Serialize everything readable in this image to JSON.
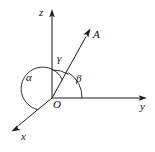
{
  "figure": {
    "kind": "3d-axes-direction-angles",
    "background_color": "#ffffff",
    "stroke_color": "#1a1a1a",
    "axes": [
      {
        "id": "z",
        "label": "z",
        "direction": "up"
      },
      {
        "id": "y",
        "label": "y",
        "direction": "right"
      },
      {
        "id": "x",
        "label": "x",
        "direction": "down-left"
      }
    ],
    "origin": {
      "label": "O"
    },
    "vector": {
      "label": "A",
      "direction": "up-right"
    },
    "angles": [
      {
        "id": "alpha",
        "label": "α",
        "between": "x-axis and vector A"
      },
      {
        "id": "beta",
        "label": "β",
        "between": "y-axis and vector A"
      },
      {
        "id": "gamma",
        "label": "γ",
        "between": "z-axis and vector A"
      }
    ],
    "labels": {
      "z_axis": "z",
      "y_axis": "y",
      "x_axis": "x",
      "origin": "O",
      "vector_a": "A",
      "alpha": "α",
      "beta": "β",
      "gamma": "γ"
    }
  }
}
